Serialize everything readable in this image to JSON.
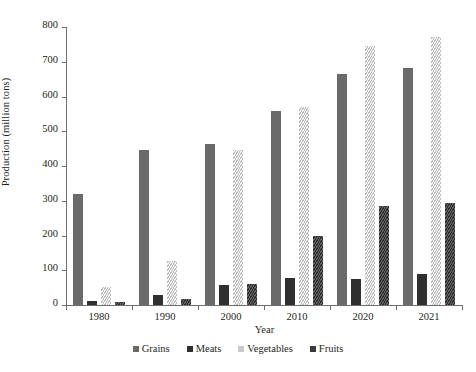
{
  "chart_data": {
    "type": "bar",
    "title": "",
    "xlabel": "Year",
    "ylabel": "Production (million tons)",
    "categories": [
      "1980",
      "1990",
      "2000",
      "2010",
      "2020",
      "2021"
    ],
    "series": [
      {
        "name": "Grains",
        "color": "#6a6a6a",
        "values": [
          320,
          445,
          462,
          557,
          665,
          682
        ]
      },
      {
        "name": "Meats",
        "color": "#2f2f2f",
        "values": [
          12,
          28,
          58,
          78,
          75,
          88
        ]
      },
      {
        "name": "Vegetables",
        "color": "#c9c9c9",
        "values": [
          52,
          128,
          445,
          570,
          745,
          770
        ]
      },
      {
        "name": "Fruits",
        "color": "#3a3a3a",
        "values": [
          8,
          18,
          60,
          200,
          285,
          295
        ]
      }
    ],
    "ylim": [
      0,
      800
    ],
    "ytick_labels": [
      "0",
      "100",
      "200",
      "300",
      "400",
      "500",
      "600",
      "700",
      "800"
    ],
    "ytick_values": [
      0,
      100,
      200,
      300,
      400,
      500,
      600,
      700,
      800
    ],
    "grid": false,
    "legend_position": "bottom",
    "legend_entries": [
      "Grains",
      "Meats",
      "Vegetables",
      "Fruits"
    ]
  }
}
